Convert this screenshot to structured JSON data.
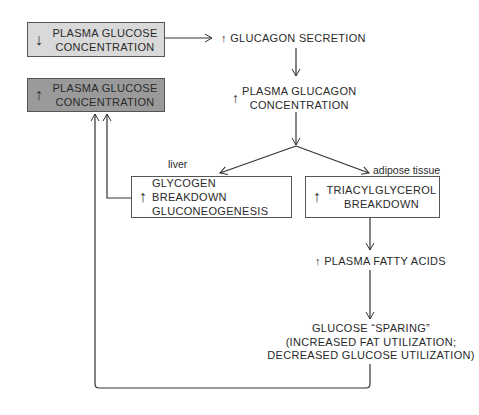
{
  "colors": {
    "box_decrease_fill": "#d9d9d9",
    "box_increase_fill": "#9a9a9a",
    "line": "#333333"
  },
  "nodes": {
    "low_glucose": {
      "direction": "↓",
      "line1": "PLASMA GLUCOSE",
      "line2": "CONCENTRATION"
    },
    "high_glucose": {
      "direction": "↑",
      "line1": "PLASMA GLUCOSE",
      "line2": "CONCENTRATION"
    },
    "glucagon_secretion": {
      "direction": "↑",
      "text": "GLUCAGON SECRETION"
    },
    "plasma_glucagon": {
      "direction": "↑",
      "line1": "PLASMA GLUCAGON",
      "line2": "CONCENTRATION"
    },
    "liver_effects": {
      "direction": "↑",
      "line1": "GLYCOGEN BREAKDOWN",
      "line2": "GLUCONEOGENESIS"
    },
    "adipose_effects": {
      "direction": "↑",
      "line1": "TRIACYLGLYCEROL",
      "line2": "BREAKDOWN"
    },
    "fatty_acids": {
      "direction": "↑",
      "text": "PLASMA FATTY ACIDS"
    },
    "glucose_sparing": {
      "line1": "GLUCOSE “SPARING”",
      "line2": "(INCREASED FAT UTILIZATION;",
      "line3": "DECREASED GLUCOSE UTILIZATION)"
    }
  },
  "labels": {
    "liver": "liver",
    "adipose": "adipose tissue"
  }
}
